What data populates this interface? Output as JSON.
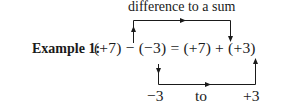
{
  "top_caption": "difference to a sum",
  "example_label": "Example 1:",
  "equation": "(+7) − (−3) = (+7) + (+3)",
  "bottom_labels": {
    "from": "−3",
    "to": "to",
    "target": "+3"
  }
}
